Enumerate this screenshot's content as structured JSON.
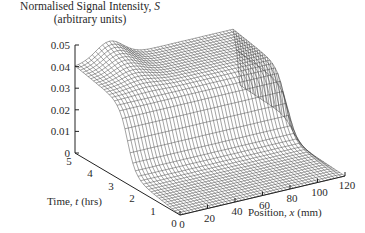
{
  "chart_data": {
    "type": "surface3d",
    "title": "Normalised Signal Intensity, S",
    "subtitle": "(arbitrary units)",
    "zlabel": "Normalised Signal Intensity, S (arbitrary units)",
    "xlabel": "Position, x (mm)",
    "ylabel": "Time, t (hrs)",
    "x_ticks": [
      0,
      20,
      40,
      60,
      80,
      100,
      120
    ],
    "y_ticks": [
      0,
      1,
      2,
      3,
      4,
      5
    ],
    "z_ticks": [
      0,
      0.01,
      0.02,
      0.03,
      0.04,
      0.05
    ],
    "xlim": [
      0,
      120
    ],
    "ylim": [
      0,
      5
    ],
    "zlim": [
      0,
      0.05
    ],
    "grid": false,
    "legend": null,
    "style": "wireframe mesh",
    "approx_surface": {
      "x": [
        0,
        20,
        40,
        60,
        80,
        100,
        120
      ],
      "t": [
        0,
        1,
        2,
        3,
        4,
        5
      ],
      "S": [
        [
          0.0,
          0.0,
          0.0,
          0.0,
          0.0,
          0.0,
          0.0
        ],
        [
          0.003,
          0.004,
          0.004,
          0.004,
          0.004,
          0.003,
          0.002
        ],
        [
          0.006,
          0.008,
          0.008,
          0.008,
          0.008,
          0.007,
          0.004
        ],
        [
          0.038,
          0.04,
          0.039,
          0.037,
          0.037,
          0.036,
          0.02
        ],
        [
          0.042,
          0.046,
          0.044,
          0.04,
          0.04,
          0.039,
          0.022
        ],
        [
          0.044,
          0.048,
          0.046,
          0.041,
          0.041,
          0.04,
          0.024
        ]
      ]
    }
  },
  "labels": {
    "title_line1": "Normalised Signal Intensity, ",
    "title_var": "S",
    "title_line2": "(arbitrary units)",
    "x_axis_pre": "Position, ",
    "x_axis_var": "x",
    "x_axis_post": " (mm)",
    "y_axis_pre": "Time, ",
    "y_axis_var": "t",
    "y_axis_post": " (hrs)"
  }
}
